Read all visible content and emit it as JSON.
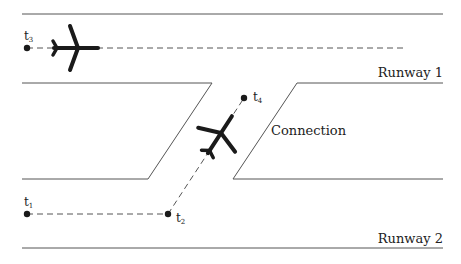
{
  "diagram": {
    "runway1": {
      "label": "Runway 1"
    },
    "runway2": {
      "label": "Runway 2"
    },
    "connection": {
      "label": "Connection"
    },
    "time_points": [
      {
        "id": "t1",
        "base": "t",
        "sub": "1"
      },
      {
        "id": "t2",
        "base": "t",
        "sub": "2"
      },
      {
        "id": "t3",
        "base": "t",
        "sub": "3"
      },
      {
        "id": "t4",
        "base": "t",
        "sub": "4"
      }
    ],
    "colors": {
      "line": "#555555",
      "ink": "#1a1a1a",
      "background": "#ffffff"
    }
  }
}
